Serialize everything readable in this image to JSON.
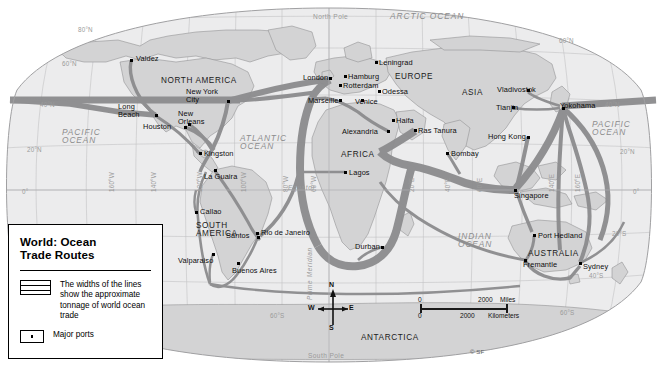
{
  "title": "World: Ocean Trade Routes",
  "legend": {
    "title_line1": "World: Ocean",
    "title_line2": "Trade Routes",
    "routes_label": "The widths of the lines show the approximate tonnage of world ocean trade",
    "ports_label": "Major ports"
  },
  "scale": {
    "zero_miles": "0",
    "miles_value": "2000",
    "miles_unit": "Miles",
    "zero_km": "0",
    "km_value": "2000",
    "km_unit": "Kilometers"
  },
  "compass": {
    "n": "N",
    "s": "S",
    "e": "E",
    "w": "W"
  },
  "credit": "© SF",
  "oceans": [
    {
      "name": "PACIFIC OCEAN",
      "line1": "PACIFIC",
      "line2": "OCEAN",
      "x": 62,
      "y": 128
    },
    {
      "name": "ATLANTIC OCEAN",
      "line1": "ATLANTIC",
      "line2": "OCEAN",
      "x": 240,
      "y": 134
    },
    {
      "name": "INDIAN OCEAN",
      "line1": "INDIAN",
      "line2": "OCEAN",
      "x": 458,
      "y": 232
    },
    {
      "name": "PACIFIC OCEAN right",
      "line1": "PACIFIC",
      "line2": "OCEAN",
      "x": 592,
      "y": 120
    },
    {
      "name": "ARCTIC OCEAN",
      "line1": "ARCTIC",
      "line2": "",
      "x": 400,
      "y": 14
    }
  ],
  "arctic_label": "ARCTIC OCEAN",
  "continents": [
    {
      "label": "NORTH AMERICA",
      "x": 161,
      "y": 77
    },
    {
      "label": "SOUTH AMERICA",
      "line1": "SOUTH",
      "line2": "AMERICA",
      "x": 196,
      "y": 222
    },
    {
      "label": "EUROPE",
      "x": 395,
      "y": 73
    },
    {
      "label": "AFRICA",
      "x": 341,
      "y": 151
    },
    {
      "label": "ASIA",
      "x": 462,
      "y": 89
    },
    {
      "label": "AUSTRALIA",
      "x": 528,
      "y": 250
    },
    {
      "label": "ANTARCTICA",
      "x": 361,
      "y": 334
    }
  ],
  "poles": [
    {
      "label": "North Pole",
      "x": 313,
      "y": 13
    },
    {
      "label": "South Pole",
      "x": 308,
      "y": 352
    }
  ],
  "equator_label": "Equator",
  "prime_meridian_label": "Prime Meridian",
  "graticule": {
    "latitudes_left": [
      {
        "label": "80°N",
        "x": 78,
        "y": 26
      },
      {
        "label": "60°N",
        "x": 62,
        "y": 60
      },
      {
        "label": "40°N",
        "x": 40,
        "y": 101
      },
      {
        "label": "20°N",
        "x": 27,
        "y": 146
      },
      {
        "label": "0°",
        "x": 22,
        "y": 188
      }
    ],
    "latitudes_right": [
      {
        "label": "60°N",
        "x": 559,
        "y": 37
      },
      {
        "label": "40°N",
        "x": 605,
        "y": 101
      },
      {
        "label": "20°N",
        "x": 620,
        "y": 148
      },
      {
        "label": "0°",
        "x": 633,
        "y": 188
      },
      {
        "label": "20°S",
        "x": 612,
        "y": 230
      },
      {
        "label": "40°S",
        "x": 589,
        "y": 272
      },
      {
        "label": "60°S",
        "x": 560,
        "y": 309
      }
    ],
    "latitudes_mid": [
      {
        "label": "20°S",
        "x": 40,
        "y": 232
      },
      {
        "label": "40°S",
        "x": 56,
        "y": 272
      },
      {
        "label": "60°S",
        "x": 270,
        "y": 312
      }
    ],
    "longitudes": [
      {
        "label": "160°W",
        "x": 108,
        "y": 192
      },
      {
        "label": "140°W",
        "x": 150,
        "y": 192
      },
      {
        "label": "120°W",
        "x": 196,
        "y": 192
      },
      {
        "label": "100°W",
        "x": 240,
        "y": 192
      },
      {
        "label": "80°W",
        "x": 282,
        "y": 192
      },
      {
        "label": "60°W",
        "x": 310,
        "y": 192
      },
      {
        "label": "20°E",
        "x": 408,
        "y": 192
      },
      {
        "label": "40°E",
        "x": 444,
        "y": 192
      },
      {
        "label": "60°E",
        "x": 476,
        "y": 192
      },
      {
        "label": "140°E",
        "x": 548,
        "y": 192
      },
      {
        "label": "160°E",
        "x": 574,
        "y": 192
      }
    ]
  },
  "ports": [
    {
      "name": "Valdez",
      "x": 131,
      "y": 60,
      "lx": 136,
      "ly": 55,
      "anchor": "left"
    },
    {
      "name": "Long Beach",
      "x": 156,
      "y": 115,
      "lx": 118,
      "ly": 103,
      "anchor": "left",
      "line1": "Long",
      "line2": "Beach"
    },
    {
      "name": "Houston",
      "x": 185,
      "y": 127,
      "lx": 143,
      "ly": 123,
      "anchor": "left"
    },
    {
      "name": "New Orleans",
      "x": 189,
      "y": 124,
      "lx": 178,
      "ly": 110,
      "anchor": "left",
      "line1": "New",
      "line2": "Orleans"
    },
    {
      "name": "New York City",
      "x": 228,
      "y": 101,
      "lx": 186,
      "ly": 88,
      "anchor": "left",
      "line1": "New York",
      "line2": "City"
    },
    {
      "name": "Kingston",
      "x": 200,
      "y": 153,
      "lx": 204,
      "ly": 150,
      "anchor": "left"
    },
    {
      "name": "La Guaira",
      "x": 215,
      "y": 170,
      "lx": 204,
      "ly": 173,
      "anchor": "left"
    },
    {
      "name": "Callao",
      "x": 196,
      "y": 212,
      "lx": 200,
      "ly": 208,
      "anchor": "left"
    },
    {
      "name": "Valparaiso",
      "x": 213,
      "y": 254,
      "lx": 178,
      "ly": 257,
      "anchor": "left"
    },
    {
      "name": "Buenos Aires",
      "x": 238,
      "y": 263,
      "lx": 232,
      "ly": 267,
      "anchor": "left"
    },
    {
      "name": "Santos",
      "x": 258,
      "y": 237,
      "lx": 226,
      "ly": 232,
      "anchor": "left"
    },
    {
      "name": "Rio de Janeiro",
      "x": 257,
      "y": 233,
      "lx": 261,
      "ly": 229,
      "anchor": "left"
    },
    {
      "name": "London",
      "x": 330,
      "y": 78,
      "lx": 303,
      "ly": 74,
      "anchor": "left"
    },
    {
      "name": "Hamburg",
      "x": 345,
      "y": 76,
      "lx": 348,
      "ly": 73,
      "anchor": "left"
    },
    {
      "name": "Rotterdam",
      "x": 340,
      "y": 85,
      "lx": 343,
      "ly": 82,
      "anchor": "left"
    },
    {
      "name": "Leningrad",
      "x": 376,
      "y": 62,
      "lx": 379,
      "ly": 59,
      "anchor": "left"
    },
    {
      "name": "Marseille",
      "x": 340,
      "y": 100,
      "lx": 308,
      "ly": 97,
      "anchor": "left"
    },
    {
      "name": "Venice",
      "x": 362,
      "y": 100,
      "lx": 355,
      "ly": 98,
      "anchor": "left"
    },
    {
      "name": "Odessa",
      "x": 379,
      "y": 91,
      "lx": 382,
      "ly": 88,
      "anchor": "left"
    },
    {
      "name": "Alexandria",
      "x": 388,
      "y": 131,
      "lx": 342,
      "ly": 128,
      "anchor": "left"
    },
    {
      "name": "Haifa",
      "x": 393,
      "y": 120,
      "lx": 396,
      "ly": 117,
      "anchor": "left"
    },
    {
      "name": "Ras Tanura",
      "x": 415,
      "y": 130,
      "lx": 418,
      "ly": 127,
      "anchor": "left"
    },
    {
      "name": "Bombay",
      "x": 447,
      "y": 153,
      "lx": 451,
      "ly": 150,
      "anchor": "left"
    },
    {
      "name": "Lagos",
      "x": 345,
      "y": 172,
      "lx": 349,
      "ly": 169,
      "anchor": "left"
    },
    {
      "name": "Durban",
      "x": 382,
      "y": 247,
      "lx": 355,
      "ly": 243,
      "anchor": "left"
    },
    {
      "name": "Vladivostok",
      "x": 528,
      "y": 90,
      "lx": 497,
      "ly": 86,
      "anchor": "left"
    },
    {
      "name": "Tianjin",
      "x": 513,
      "y": 107,
      "lx": 496,
      "ly": 104,
      "anchor": "left"
    },
    {
      "name": "Yokohama",
      "x": 563,
      "y": 108,
      "lx": 560,
      "ly": 102,
      "anchor": "left"
    },
    {
      "name": "Hong Kong",
      "x": 528,
      "y": 137,
      "lx": 488,
      "ly": 133,
      "anchor": "left"
    },
    {
      "name": "Singapore",
      "x": 515,
      "y": 190,
      "lx": 514,
      "ly": 192,
      "anchor": "left"
    },
    {
      "name": "Port Hedland",
      "x": 534,
      "y": 235,
      "lx": 538,
      "ly": 232,
      "anchor": "left"
    },
    {
      "name": "Fremantle",
      "x": 525,
      "y": 260,
      "lx": 523,
      "ly": 261,
      "anchor": "left"
    },
    {
      "name": "Sydney",
      "x": 580,
      "y": 263,
      "lx": 583,
      "ly": 263,
      "anchor": "left"
    }
  ]
}
